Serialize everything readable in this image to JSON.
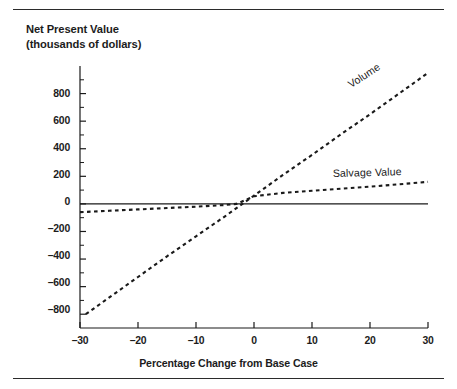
{
  "figure": {
    "top_rule": "rule-top",
    "bottom_rule": "rule-bottom"
  },
  "chart_data": {
    "type": "line",
    "title": "",
    "ylabel_line1": "Net Present Value",
    "ylabel_line2": "(thousands of dollars)",
    "xlabel": "Percentage Change from Base Case",
    "xlim": [
      -30,
      30
    ],
    "ylim": [
      -900,
      1000
    ],
    "xticks": [
      -30,
      -20,
      -10,
      0,
      10,
      20,
      30
    ],
    "xtick_labels": [
      "–30",
      "–20",
      "–10",
      "0",
      "10",
      "20",
      "30"
    ],
    "yticks": [
      800,
      600,
      400,
      200,
      0,
      -200,
      -400,
      -600,
      -800
    ],
    "ytick_labels": [
      "800",
      "600",
      "400",
      "200",
      "0",
      "–200",
      "–400",
      "–600",
      "–800"
    ],
    "yminor_step": 100,
    "grid": false,
    "legend_position": "inline-annotations",
    "zero_line": 0,
    "series": [
      {
        "name": "Volume",
        "style": "dashed",
        "label_rotation": -33,
        "x": [
          -29,
          -25,
          -20,
          -15,
          -10,
          -5,
          -2,
          0,
          5,
          10,
          15,
          20,
          25,
          30
        ],
        "values": [
          -800,
          -680,
          -530,
          -380,
          -235,
          -90,
          0,
          60,
          210,
          355,
          505,
          650,
          800,
          950
        ]
      },
      {
        "name": "Salvage Value",
        "style": "dashed",
        "label_rotation": -1.5,
        "x": [
          -30,
          -25,
          -20,
          -15,
          -10,
          -5,
          -3,
          0,
          5,
          10,
          15,
          20,
          25,
          30
        ],
        "values": [
          -60,
          -50,
          -40,
          -30,
          -20,
          -8,
          0,
          55,
          80,
          95,
          110,
          125,
          142,
          160
        ]
      },
      {
        "name": "Zero Reference",
        "style": "solid",
        "x": [
          -30,
          30
        ],
        "values": [
          0,
          0
        ]
      }
    ]
  },
  "colors": {
    "ink": "#1c1c1c",
    "rule": "#2b2b2b",
    "axis": "#1a1a1a",
    "background": "#ffffff"
  }
}
